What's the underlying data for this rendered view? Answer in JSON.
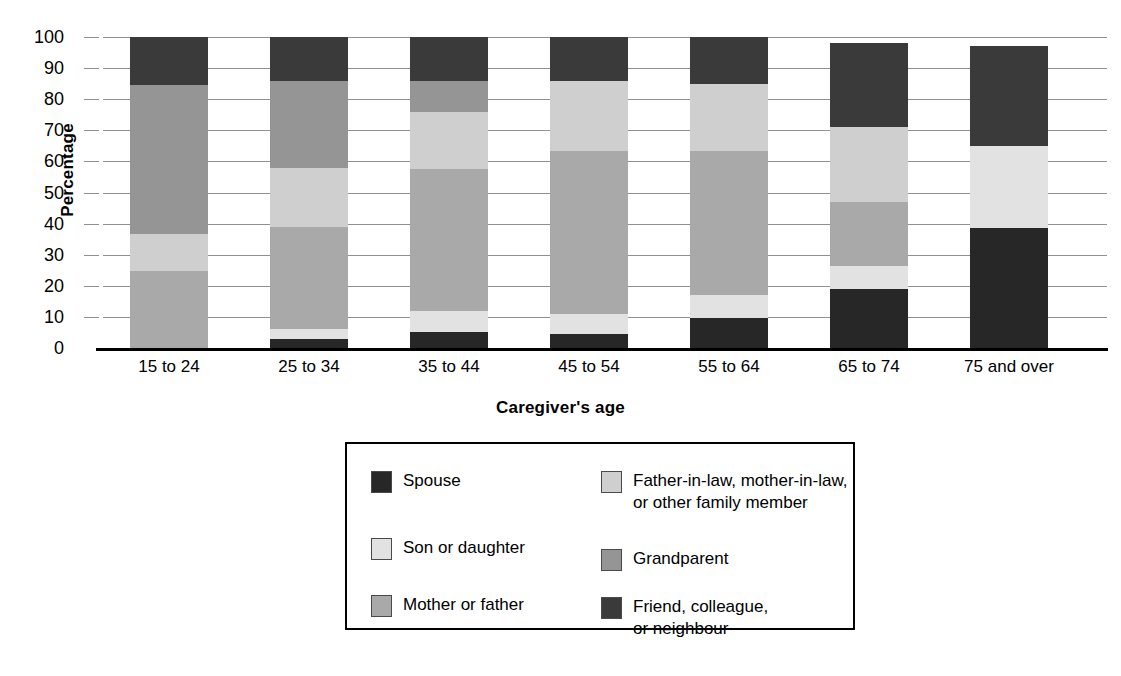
{
  "chart_data": {
    "type": "bar",
    "subtype": "stacked-100",
    "title": "",
    "xlabel": "Caregiver's age",
    "ylabel": "Percentage",
    "ylim": [
      0,
      100
    ],
    "yticks": [
      0,
      10,
      20,
      30,
      40,
      50,
      60,
      70,
      80,
      90,
      100
    ],
    "ytick_labels": [
      "0",
      "10",
      "20",
      "30",
      "40",
      "50",
      "60",
      "70",
      "80",
      "90",
      "100"
    ],
    "grid": true,
    "legend_position": "below-center",
    "categories": [
      "15 to 24",
      "25 to 34",
      "35 to 44",
      "45 to 54",
      "55 to 64",
      "65 to 74",
      "75 and over"
    ],
    "series": [
      {
        "name": "Spouse",
        "color": "#272727",
        "values": [
          0,
          3,
          5,
          4.5,
          9.5,
          19,
          38.5
        ]
      },
      {
        "name": "Son or daughter",
        "color": "#e2e2e2",
        "values": [
          0,
          3,
          7,
          6.5,
          7.5,
          7.5,
          26.5
        ]
      },
      {
        "name": "Mother or father",
        "color": "#a9a9a9",
        "values": [
          24.8,
          33,
          45.5,
          52.5,
          46.5,
          20.5,
          0
        ]
      },
      {
        "name": "Father-in-law, mother-in-law,\nor other family member",
        "color": "#cfcfcf",
        "values": [
          11.9,
          19,
          18.5,
          22.5,
          21.5,
          24,
          0
        ]
      },
      {
        "name": "Grandparent",
        "color": "#959595",
        "values": [
          47.9,
          28,
          10,
          0,
          0,
          0,
          0
        ]
      },
      {
        "name": "Friend, colleague,\nor neighbour",
        "color": "#3a3a3a",
        "values": [
          15.4,
          14,
          14,
          14,
          15,
          27,
          32
        ]
      }
    ],
    "stack_tops": {
      "15 to 24": [
        0,
        0,
        24.8,
        36.7,
        84.6,
        100
      ],
      "25 to 34": [
        3,
        6,
        39,
        58,
        86,
        100
      ],
      "35 to 44": [
        5,
        12,
        57.5,
        76,
        86,
        100
      ],
      "45 to 54": [
        4.5,
        11,
        63.5,
        86,
        86,
        100
      ],
      "55 to 64": [
        9.5,
        17,
        63.5,
        85,
        85,
        100
      ],
      "65 to 74": [
        19,
        26.5,
        47,
        71,
        71,
        98
      ],
      "75 and over": [
        38.5,
        65,
        65,
        65,
        65,
        97
      ]
    }
  },
  "axis": {
    "y_title": "Percentage",
    "x_title": "Caregiver's age"
  },
  "legend": {
    "items": [
      {
        "label": "Spouse",
        "color": "#272727"
      },
      {
        "label": "Father-in-law, mother-in-law,\nor other family member",
        "color": "#cfcfcf"
      },
      {
        "label": "Son or daughter",
        "color": "#e2e2e2"
      },
      {
        "label": "Grandparent",
        "color": "#959595"
      },
      {
        "label": "Mother or father",
        "color": "#a9a9a9"
      },
      {
        "label": "Friend, colleague,\nor neighbour",
        "color": "#3a3a3a"
      }
    ]
  }
}
